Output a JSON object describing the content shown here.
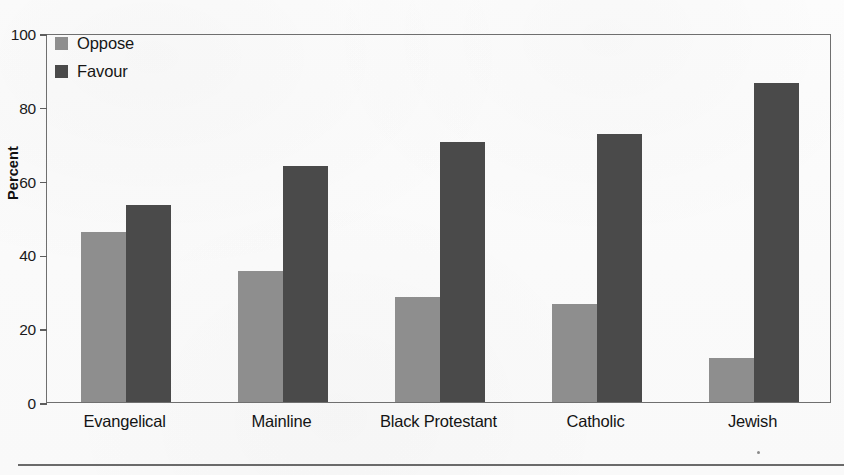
{
  "chart_data": {
    "type": "bar",
    "title": "",
    "subtitle": "",
    "xlabel": "",
    "ylabel": "Percent",
    "ylim": [
      0,
      100
    ],
    "ytick_labels": [
      "100",
      "80",
      "60",
      "40",
      "20",
      "0"
    ],
    "ytick_values": [
      100,
      80,
      60,
      40,
      20,
      0
    ],
    "grid": false,
    "legend_position": "top-left",
    "categories": [
      "Evangelical",
      "Mainline",
      "Black Protestant",
      "Catholic",
      "Jewish"
    ],
    "series": [
      {
        "name": "Oppose",
        "color": "#8e8e8e",
        "values": [
          46,
          35.5,
          28.5,
          26.5,
          12
        ]
      },
      {
        "name": "Favour",
        "color": "#4a4a4a",
        "values": [
          53.5,
          64,
          70.5,
          72.5,
          86.5
        ]
      }
    ]
  },
  "axis": {
    "y_title": "Percent"
  },
  "legend": {
    "entries": [
      {
        "label": "Oppose",
        "color": "#8e8e8e"
      },
      {
        "label": "Favour",
        "color": "#4a4a4a"
      }
    ]
  },
  "colors": {
    "oppose": "#8e8e8e",
    "favour": "#4a4a4a",
    "axis_line": "#6f6f6f",
    "text": "#141414",
    "background": "#fcfcfc"
  }
}
